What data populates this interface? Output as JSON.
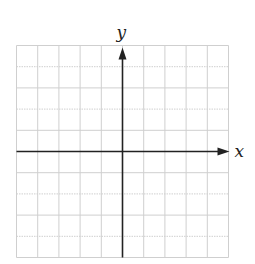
{
  "diagram": {
    "type": "coordinate-grid",
    "grid": {
      "columns": 10,
      "rows": 10,
      "line_color": "#cfcfcf"
    },
    "axes": {
      "x_label": "x",
      "y_label": "y",
      "color": "#222222",
      "origin_col": 5,
      "origin_row": 5
    }
  }
}
